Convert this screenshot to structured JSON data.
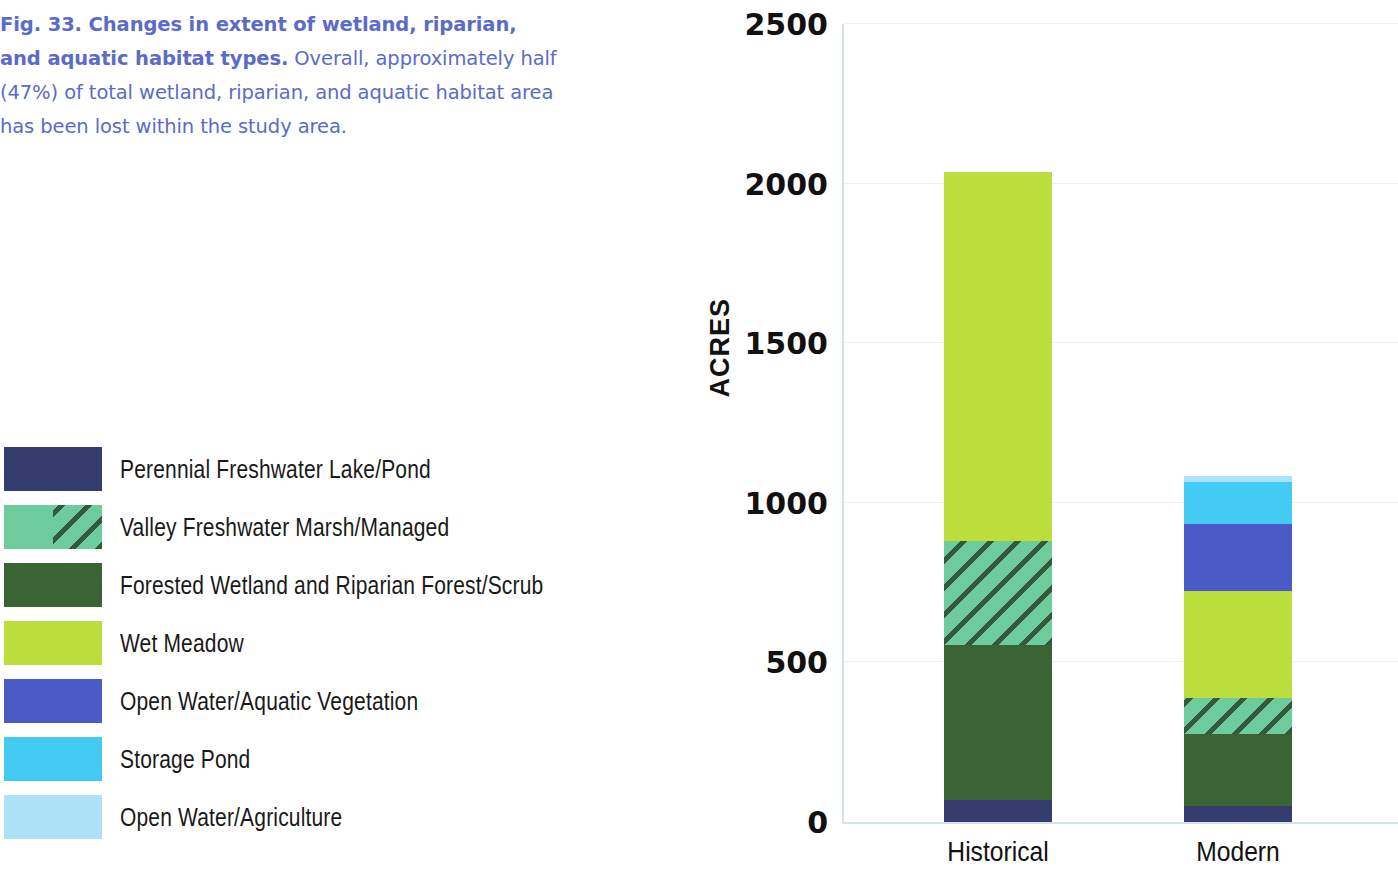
{
  "caption": {
    "bold": "Fig. 33. Changes in extent of wetland, riparian, and aquatic habitat types.",
    "rest": " Overall, approximately half (47%) of total wetland, riparian, and aquatic habitat area has been lost within the study area.",
    "color": "#5b6bc8"
  },
  "legend": {
    "items": [
      {
        "label": "Perennial Freshwater Lake/Pond",
        "color": "#353c6e",
        "hatched": false
      },
      {
        "label": "Valley Freshwater Marsh/Managed",
        "color": "#6ecb9b",
        "hatched": true
      },
      {
        "label": "Forested Wetland and Riparian Forest/Scrub",
        "color": "#3b6434",
        "hatched": false
      },
      {
        "label": "Wet Meadow",
        "color": "#bcde3c",
        "hatched": false
      },
      {
        "label": "Open Water/Aquatic Vegetation",
        "color": "#4a5bc8",
        "hatched": false
      },
      {
        "label": "Storage Pond",
        "color": "#44cbf3",
        "hatched": false
      },
      {
        "label": "Open Water/Agriculture",
        "color": "#ade1f7",
        "hatched": false
      }
    ]
  },
  "chart_data": {
    "type": "bar",
    "stacked": true,
    "title": "",
    "xlabel": "",
    "ylabel": "ACRES",
    "ylim": [
      0,
      2500
    ],
    "yticks": [
      0,
      500,
      1000,
      1500,
      2000,
      2500
    ],
    "ytick_labels": [
      "0",
      "500",
      "1000",
      "1500",
      "2000",
      "2500"
    ],
    "grid": true,
    "legend_position": "left",
    "categories": [
      "Historical",
      "Modern"
    ],
    "series": [
      {
        "name": "Perennial Freshwater Lake/Pond",
        "color": "#353c6e",
        "hatched": false,
        "values": [
          70,
          50
        ]
      },
      {
        "name": "Forested Wetland and Riparian Forest/Scrub",
        "color": "#3b6434",
        "hatched": false,
        "values": [
          485,
          225
        ]
      },
      {
        "name": "Valley Freshwater Marsh/Managed",
        "color": "#6ecb9b",
        "hatched": true,
        "values": [
          325,
          115
        ]
      },
      {
        "name": "Wet Meadow",
        "color": "#bcde3c",
        "hatched": false,
        "values": [
          1155,
          335
        ]
      },
      {
        "name": "Open Water/Aquatic Vegetation",
        "color": "#4a5bc8",
        "hatched": false,
        "values": [
          0,
          210
        ]
      },
      {
        "name": "Storage Pond",
        "color": "#44cbf3",
        "hatched": false,
        "values": [
          0,
          130
        ]
      },
      {
        "name": "Open Water/Agriculture",
        "color": "#ade1f7",
        "hatched": false,
        "values": [
          0,
          20
        ]
      }
    ],
    "totals": [
      2035,
      1085
    ]
  }
}
